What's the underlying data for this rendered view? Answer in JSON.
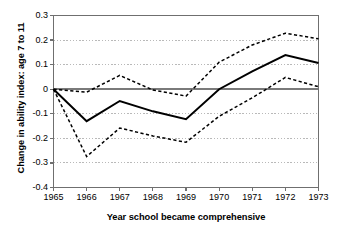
{
  "chart_data": {
    "type": "line",
    "title": "",
    "xlabel": "Year school became comprehensive",
    "ylabel": "Change in ability index: age 7 to 11",
    "x": [
      1965,
      1966,
      1967,
      1968,
      1969,
      1970,
      1971,
      1972,
      1973
    ],
    "xtick_labels": [
      "1965",
      "1966",
      "1967",
      "1968",
      "1969",
      "1970",
      "1971",
      "1972",
      "1973"
    ],
    "ytick_labels": [
      "0.3",
      "0.2",
      "0.1",
      "0",
      "-0.1",
      "-0.2",
      "-0.3",
      "-0.4"
    ],
    "ytick_values": [
      0.3,
      0.2,
      0.1,
      0,
      -0.1,
      -0.2,
      -0.3,
      -0.4
    ],
    "ylim": [
      -0.4,
      0.3
    ],
    "xlim": [
      1965,
      1973
    ],
    "grid": "horizontal-dotted",
    "legend": "none",
    "zero_line": true,
    "series": [
      {
        "name": "Upper confidence limit",
        "style": "dashed",
        "color": "#000000",
        "values": [
          0.0,
          -0.012,
          0.056,
          -0.003,
          -0.028,
          0.11,
          0.18,
          0.228,
          0.205
        ]
      },
      {
        "name": "Estimated change in ability index",
        "style": "solid",
        "color": "#000000",
        "values": [
          0.0,
          -0.13,
          -0.048,
          -0.09,
          -0.122,
          0.0,
          0.073,
          0.139,
          0.107
        ]
      },
      {
        "name": "Lower confidence limit",
        "style": "dashed",
        "color": "#000000",
        "values": [
          0.0,
          -0.274,
          -0.158,
          -0.19,
          -0.216,
          -0.11,
          -0.035,
          0.048,
          0.01
        ]
      }
    ]
  },
  "axes": {
    "y_title": "Change in ability index: age 7 to 11",
    "x_title": "Year school became comprehensive"
  },
  "colors": {
    "line": "#000000",
    "grid": "#b9b9b9",
    "axis": "#6f6f6f",
    "zero_line": "#7a7a7a",
    "background": "#ffffff"
  }
}
